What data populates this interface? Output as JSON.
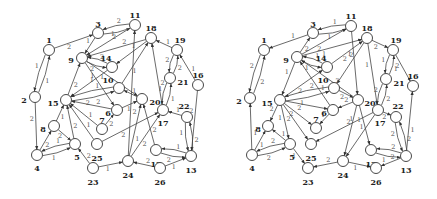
{
  "figure": {
    "colors": {
      "node_stroke": "#333333",
      "node_fill": "#ffffff",
      "edge": "#444444",
      "label": "#222222",
      "weight": "#555555"
    },
    "node_radius": 5.5
  },
  "graphs": [
    {
      "name": "left-graph",
      "nodes": [
        {
          "id": "1",
          "x": 49,
          "y": 50,
          "lx": 49,
          "ly": 40
        },
        {
          "id": "2",
          "x": 35,
          "y": 97,
          "lx": 24,
          "ly": 100
        },
        {
          "id": "3",
          "x": 98,
          "y": 33,
          "lx": 98,
          "ly": 24
        },
        {
          "id": "11",
          "x": 135,
          "y": 25,
          "lx": 135,
          "ly": 15
        },
        {
          "id": "18",
          "x": 151,
          "y": 38,
          "lx": 151,
          "ly": 28
        },
        {
          "id": "19",
          "x": 177,
          "y": 50,
          "lx": 180,
          "ly": 40
        },
        {
          "id": "9",
          "x": 82,
          "y": 58,
          "lx": 71,
          "ly": 60
        },
        {
          "id": "14",
          "x": 112,
          "y": 67,
          "lx": 106,
          "ly": 58
        },
        {
          "id": "10",
          "x": 119,
          "y": 88,
          "lx": 108,
          "ly": 80
        },
        {
          "id": "21",
          "x": 170,
          "y": 78,
          "lx": 183,
          "ly": 82
        },
        {
          "id": "16",
          "x": 198,
          "y": 85,
          "lx": 198,
          "ly": 75
        },
        {
          "id": "15",
          "x": 66,
          "y": 100,
          "lx": 53,
          "ly": 103
        },
        {
          "id": "20",
          "x": 142,
          "y": 99,
          "lx": 155,
          "ly": 102
        },
        {
          "id": "6",
          "x": 117,
          "y": 110,
          "lx": 108,
          "ly": 113
        },
        {
          "id": "17",
          "x": 163,
          "y": 110,
          "lx": 163,
          "ly": 123
        },
        {
          "id": "22",
          "x": 187,
          "y": 117,
          "lx": 184,
          "ly": 106
        },
        {
          "id": "8",
          "x": 54,
          "y": 126,
          "lx": 43,
          "ly": 129
        },
        {
          "id": "7",
          "x": 102,
          "y": 129,
          "lx": 102,
          "ly": 120
        },
        {
          "id": "25",
          "x": 97,
          "y": 144,
          "lx": 97,
          "ly": 158
        },
        {
          "id": "5",
          "x": 75,
          "y": 144,
          "lx": 77,
          "ly": 157
        },
        {
          "id": "4",
          "x": 37,
          "y": 155,
          "lx": 37,
          "ly": 168
        },
        {
          "id": "12",
          "x": 156,
          "y": 150,
          "lx": 156,
          "ly": 164
        },
        {
          "id": "13",
          "x": 191,
          "y": 156,
          "lx": 191,
          "ly": 170
        },
        {
          "id": "24",
          "x": 128,
          "y": 161,
          "lx": 128,
          "ly": 175
        },
        {
          "id": "26",
          "x": 160,
          "y": 168,
          "lx": 160,
          "ly": 182
        },
        {
          "id": "23",
          "x": 93,
          "y": 168,
          "lx": 93,
          "ly": 182
        }
      ],
      "edges": [
        {
          "from": "1",
          "to": "3",
          "w": "2"
        },
        {
          "from": "1",
          "to": "2",
          "w": "1"
        },
        {
          "from": "2",
          "to": "1",
          "w": "1"
        },
        {
          "from": "2",
          "to": "4",
          "w": "2"
        },
        {
          "from": "3",
          "to": "11",
          "w": "2"
        },
        {
          "from": "11",
          "to": "3",
          "w": "2"
        },
        {
          "from": "3",
          "to": "9",
          "w": "1"
        },
        {
          "from": "11",
          "to": "9",
          "w": "1"
        },
        {
          "from": "18",
          "to": "9",
          "w": "2"
        },
        {
          "from": "18",
          "to": "14",
          "w": "1"
        },
        {
          "from": "19",
          "to": "18",
          "w": "1"
        },
        {
          "from": "14",
          "to": "9",
          "w": "2"
        },
        {
          "from": "9",
          "to": "14",
          "w": "2"
        },
        {
          "from": "10",
          "to": "18",
          "w": "1"
        },
        {
          "from": "24",
          "to": "11",
          "w": "2"
        },
        {
          "from": "17",
          "to": "18",
          "w": "2"
        },
        {
          "from": "21",
          "to": "19",
          "w": "2"
        },
        {
          "from": "19",
          "to": "21",
          "w": "2"
        },
        {
          "from": "16",
          "to": "19",
          "w": "1"
        },
        {
          "from": "15",
          "to": "9",
          "w": "2"
        },
        {
          "from": "9",
          "to": "6",
          "w": "1"
        },
        {
          "from": "9",
          "to": "20",
          "w": "1"
        },
        {
          "from": "14",
          "to": "15",
          "w": "1"
        },
        {
          "from": "10",
          "to": "15",
          "w": "1"
        },
        {
          "from": "15",
          "to": "10",
          "w": "2"
        },
        {
          "from": "20",
          "to": "10",
          "w": "1"
        },
        {
          "from": "6",
          "to": "15",
          "w": "2"
        },
        {
          "from": "6",
          "to": "20",
          "w": "1"
        },
        {
          "from": "7",
          "to": "6",
          "w": "2"
        },
        {
          "from": "7",
          "to": "15",
          "w": "1"
        },
        {
          "from": "25",
          "to": "15",
          "w": "1"
        },
        {
          "from": "25",
          "to": "17",
          "w": "2"
        },
        {
          "from": "21",
          "to": "17",
          "w": "1"
        },
        {
          "from": "17",
          "to": "21",
          "w": "1"
        },
        {
          "from": "22",
          "to": "17",
          "w": "1"
        },
        {
          "from": "16",
          "to": "13",
          "w": "2"
        },
        {
          "from": "13",
          "to": "22",
          "w": "2"
        },
        {
          "from": "22",
          "to": "13",
          "w": "1"
        },
        {
          "from": "12",
          "to": "13",
          "w": "2"
        },
        {
          "from": "13",
          "to": "12",
          "w": "1"
        },
        {
          "from": "12",
          "to": "20",
          "w": "2"
        },
        {
          "from": "24",
          "to": "17",
          "w": "2"
        },
        {
          "from": "24",
          "to": "20",
          "w": "1"
        },
        {
          "from": "26",
          "to": "24",
          "w": "2"
        },
        {
          "from": "26",
          "to": "13",
          "w": "1"
        },
        {
          "from": "23",
          "to": "24",
          "w": "1"
        },
        {
          "from": "23",
          "to": "5",
          "w": "2"
        },
        {
          "from": "8",
          "to": "15",
          "w": "1"
        },
        {
          "from": "8",
          "to": "5",
          "w": "2"
        },
        {
          "from": "5",
          "to": "15",
          "w": "2"
        },
        {
          "from": "4",
          "to": "8",
          "w": "2"
        },
        {
          "from": "4",
          "to": "5",
          "w": "1"
        },
        {
          "from": "5",
          "to": "4",
          "w": "1"
        }
      ]
    },
    {
      "name": "right-graph",
      "nodes": [
        {
          "id": "1",
          "x": 264,
          "y": 50,
          "lx": 264,
          "ly": 40
        },
        {
          "id": "2",
          "x": 250,
          "y": 98,
          "lx": 239,
          "ly": 101
        },
        {
          "id": "3",
          "x": 313,
          "y": 33,
          "lx": 313,
          "ly": 24
        },
        {
          "id": "11",
          "x": 351,
          "y": 26,
          "lx": 351,
          "ly": 16
        },
        {
          "id": "18",
          "x": 367,
          "y": 38,
          "lx": 367,
          "ly": 28
        },
        {
          "id": "19",
          "x": 393,
          "y": 50,
          "lx": 396,
          "ly": 40
        },
        {
          "id": "9",
          "x": 297,
          "y": 57,
          "lx": 286,
          "ly": 60
        },
        {
          "id": "14",
          "x": 327,
          "y": 67,
          "lx": 321,
          "ly": 58
        },
        {
          "id": "10",
          "x": 334,
          "y": 88,
          "lx": 323,
          "ly": 80
        },
        {
          "id": "21",
          "x": 386,
          "y": 79,
          "lx": 399,
          "ly": 83
        },
        {
          "id": "16",
          "x": 413,
          "y": 86,
          "lx": 413,
          "ly": 76
        },
        {
          "id": "15",
          "x": 280,
          "y": 100,
          "lx": 267,
          "ly": 103
        },
        {
          "id": "20",
          "x": 358,
          "y": 100,
          "lx": 370,
          "ly": 103
        },
        {
          "id": "6",
          "x": 333,
          "y": 110,
          "lx": 324,
          "ly": 113
        },
        {
          "id": "17",
          "x": 378,
          "y": 110,
          "lx": 380,
          "ly": 123
        },
        {
          "id": "22",
          "x": 396,
          "y": 117,
          "lx": 398,
          "ly": 106
        },
        {
          "id": "8",
          "x": 268,
          "y": 126,
          "lx": 258,
          "ly": 129
        },
        {
          "id": "7",
          "x": 316,
          "y": 128,
          "lx": 316,
          "ly": 119
        },
        {
          "id": "25",
          "x": 311,
          "y": 144,
          "lx": 311,
          "ly": 158
        },
        {
          "id": "5",
          "x": 290,
          "y": 144,
          "lx": 292,
          "ly": 157
        },
        {
          "id": "4",
          "x": 252,
          "y": 155,
          "lx": 252,
          "ly": 168
        },
        {
          "id": "12",
          "x": 371,
          "y": 150,
          "lx": 371,
          "ly": 164
        },
        {
          "id": "13",
          "x": 406,
          "y": 156,
          "lx": 406,
          "ly": 170
        },
        {
          "id": "24",
          "x": 343,
          "y": 161,
          "lx": 343,
          "ly": 175
        },
        {
          "id": "26",
          "x": 376,
          "y": 168,
          "lx": 376,
          "ly": 182
        },
        {
          "id": "23",
          "x": 308,
          "y": 168,
          "lx": 308,
          "ly": 182
        }
      ],
      "edges": [
        {
          "from": "3",
          "to": "1",
          "w": "1"
        },
        {
          "from": "1",
          "to": "2",
          "w": "2"
        },
        {
          "from": "2",
          "to": "1",
          "w": "2"
        },
        {
          "from": "4",
          "to": "2",
          "w": "1"
        },
        {
          "from": "3",
          "to": "11",
          "w": "1"
        },
        {
          "from": "11",
          "to": "3",
          "w": "1"
        },
        {
          "from": "9",
          "to": "3",
          "w": "2"
        },
        {
          "from": "9",
          "to": "11",
          "w": "2"
        },
        {
          "from": "9",
          "to": "18",
          "w": "1"
        },
        {
          "from": "14",
          "to": "18",
          "w": "2"
        },
        {
          "from": "18",
          "to": "19",
          "w": "2"
        },
        {
          "from": "14",
          "to": "9",
          "w": "1"
        },
        {
          "from": "9",
          "to": "14",
          "w": "1"
        },
        {
          "from": "18",
          "to": "10",
          "w": "2"
        },
        {
          "from": "11",
          "to": "20",
          "w": "1"
        },
        {
          "from": "18",
          "to": "17",
          "w": "1"
        },
        {
          "from": "19",
          "to": "21",
          "w": "1"
        },
        {
          "from": "21",
          "to": "19",
          "w": "1"
        },
        {
          "from": "19",
          "to": "16",
          "w": "2"
        },
        {
          "from": "9",
          "to": "15",
          "w": "1"
        },
        {
          "from": "6",
          "to": "9",
          "w": "1"
        },
        {
          "from": "20",
          "to": "9",
          "w": "2"
        },
        {
          "from": "15",
          "to": "14",
          "w": "2"
        },
        {
          "from": "15",
          "to": "10",
          "w": "1"
        },
        {
          "from": "10",
          "to": "15",
          "w": "2"
        },
        {
          "from": "10",
          "to": "20",
          "w": "2"
        },
        {
          "from": "15",
          "to": "6",
          "w": "2"
        },
        {
          "from": "20",
          "to": "6",
          "w": "2"
        },
        {
          "from": "6",
          "to": "7",
          "w": "1"
        },
        {
          "from": "15",
          "to": "7",
          "w": "2"
        },
        {
          "from": "15",
          "to": "25",
          "w": "2"
        },
        {
          "from": "17",
          "to": "25",
          "w": "1"
        },
        {
          "from": "17",
          "to": "21",
          "w": "2"
        },
        {
          "from": "21",
          "to": "17",
          "w": "2"
        },
        {
          "from": "17",
          "to": "22",
          "w": "2"
        },
        {
          "from": "13",
          "to": "16",
          "w": "1"
        },
        {
          "from": "22",
          "to": "13",
          "w": "2"
        },
        {
          "from": "13",
          "to": "22",
          "w": "2"
        },
        {
          "from": "13",
          "to": "12",
          "w": "2"
        },
        {
          "from": "12",
          "to": "13",
          "w": "1"
        },
        {
          "from": "20",
          "to": "12",
          "w": "1"
        },
        {
          "from": "17",
          "to": "24",
          "w": "1"
        },
        {
          "from": "20",
          "to": "24",
          "w": "2"
        },
        {
          "from": "24",
          "to": "26",
          "w": "1"
        },
        {
          "from": "13",
          "to": "26",
          "w": "2"
        },
        {
          "from": "24",
          "to": "23",
          "w": "2"
        },
        {
          "from": "5",
          "to": "23",
          "w": "1"
        },
        {
          "from": "15",
          "to": "8",
          "w": "2"
        },
        {
          "from": "5",
          "to": "8",
          "w": "1"
        },
        {
          "from": "15",
          "to": "5",
          "w": "1"
        },
        {
          "from": "4",
          "to": "8",
          "w": "1"
        },
        {
          "from": "4",
          "to": "5",
          "w": "2"
        },
        {
          "from": "5",
          "to": "4",
          "w": "2"
        }
      ]
    }
  ]
}
